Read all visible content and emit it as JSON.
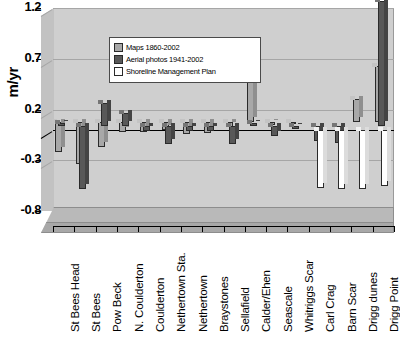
{
  "axis": {
    "y_title": "m/yr",
    "y_ticks": [
      "1.2",
      "0.7",
      "0.2",
      "-0.3",
      "-0.8"
    ]
  },
  "legend": {
    "items": [
      {
        "label": "Maps 1860-2002",
        "swatch": "light-gray",
        "color": "#a8a8a8"
      },
      {
        "label": "Aerial photos 1941-2002",
        "swatch": "dark-gray",
        "color": "#585858"
      },
      {
        "label": "Shoreline Management Plan",
        "swatch": "white",
        "color": "#ffffff"
      }
    ]
  },
  "chart_data": {
    "type": "bar",
    "title": "",
    "xlabel": "",
    "ylabel": "m/yr",
    "ylim": [
      -0.8,
      1.2
    ],
    "yticks": [
      -0.8,
      -0.3,
      0.2,
      0.7,
      1.2
    ],
    "grid": true,
    "legend_position": "upper-left-inside",
    "style": "3d-clustered-column",
    "categories": [
      "St Bees Head",
      "St Bees",
      "Pow Beck",
      "N. Coulderton",
      "Coulderton",
      "Nethertown Sta.",
      "Nethertown",
      "Braystones",
      "Sellafield",
      "Calder/Ehen",
      "Seascale",
      "Whitriggs Scar",
      "Carl Crag",
      "Barn Scar",
      "Drigg dunes",
      "Drigg Point"
    ],
    "series": [
      {
        "name": "Maps 1860-2002",
        "color": "#a8a8a8",
        "values": [
          -0.3,
          -0.42,
          -0.25,
          -0.1,
          -0.1,
          -0.08,
          -0.12,
          -0.11,
          -0.05,
          0.62,
          -0.03,
          -0.02,
          null,
          null,
          0.22,
          0.55
        ]
      },
      {
        "name": "Aerial photos 1941-2002",
        "color": "#585858",
        "values": [
          0.03,
          -0.62,
          0.22,
          0.13,
          -0.05,
          -0.18,
          -0.05,
          -0.05,
          -0.18,
          0.03,
          -0.1,
          -0.03,
          -0.15,
          -0.17,
          null,
          1.23
        ]
      },
      {
        "name": "Shoreline Management Plan",
        "color": "#ffffff",
        "values": [
          null,
          null,
          null,
          null,
          null,
          null,
          null,
          null,
          null,
          null,
          null,
          null,
          -0.57,
          -0.58,
          -0.58,
          -0.55
        ]
      }
    ]
  }
}
